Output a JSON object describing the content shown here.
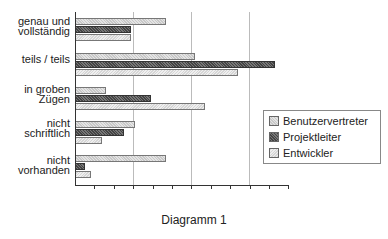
{
  "chart_data": {
    "type": "bar",
    "orientation": "horizontal",
    "title": "Diagramm 1",
    "xlabel": "",
    "ylabel": "",
    "xlim": [
      0,
      11
    ],
    "x_tick_count": 11,
    "x_tick_labels": [],
    "grid": "vertical gridlines every 3 ticks",
    "legend_position": "right",
    "categories": [
      "genau und vollständig",
      "teils / teils",
      "in groben Zügen",
      "nicht schriftlich",
      "nicht vorhanden"
    ],
    "series": [
      {
        "name": "Benutzervertreter",
        "values": [
          4.7,
          6.2,
          1.6,
          3.1,
          4.7
        ]
      },
      {
        "name": "Projektleiter",
        "values": [
          2.9,
          10.3,
          3.9,
          2.5,
          0.5
        ]
      },
      {
        "name": "Entwickler",
        "values": [
          2.9,
          8.4,
          6.7,
          1.4,
          0.8
        ]
      }
    ]
  },
  "labels": {
    "cat0": [
      "genau und",
      "vollständig"
    ],
    "cat1": [
      "teils / teils"
    ],
    "cat2": [
      "in groben",
      "Zügen"
    ],
    "cat3": [
      "nicht",
      "schriftlich"
    ],
    "cat4": [
      "nicht",
      "vorhanden"
    ]
  },
  "legend": [
    "Benutzervertreter",
    "Projektleiter",
    "Entwickler"
  ],
  "title": "Diagramm 1"
}
